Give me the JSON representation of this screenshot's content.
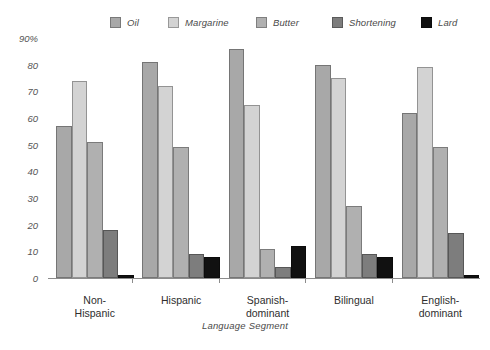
{
  "chart_data": {
    "type": "bar",
    "title": "",
    "xlabel": "Language Segment",
    "ylabel": "",
    "ylim": [
      0,
      90
    ],
    "grid": false,
    "legend_position": "top",
    "ytick_labels": [
      "90%",
      "80",
      "70",
      "60",
      "50",
      "40",
      "30",
      "20",
      "10",
      "0"
    ],
    "ytick_values": [
      90,
      80,
      70,
      60,
      50,
      40,
      30,
      20,
      10,
      0
    ],
    "categories": [
      "Non-\nHispanic",
      "Hispanic",
      "Spanish-\ndominant",
      "Bilingual",
      "English-\ndominant"
    ],
    "series": [
      {
        "name": "Oil",
        "color": "#a8a8a8",
        "values": [
          57,
          81,
          86,
          80,
          62
        ]
      },
      {
        "name": "Margarine",
        "color": "#d3d3d3",
        "values": [
          74,
          72,
          65,
          75,
          79
        ]
      },
      {
        "name": "Butter",
        "color": "#b0b0b0",
        "values": [
          51,
          49,
          11,
          27,
          49
        ]
      },
      {
        "name": "Shortening",
        "color": "#7d7d7d",
        "values": [
          18,
          9,
          4,
          9,
          17
        ]
      },
      {
        "name": "Lard",
        "color": "#111111",
        "values": [
          1,
          8,
          12,
          8,
          1
        ]
      }
    ]
  }
}
